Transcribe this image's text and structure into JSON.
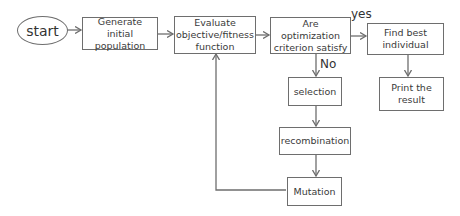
{
  "diagram": {
    "type": "flowchart",
    "colors": {
      "stroke": "#6e6e6e",
      "text": "#3a3a3a",
      "background": "#ffffff"
    },
    "nodes": {
      "start": {
        "label": "start",
        "shape": "ellipse"
      },
      "generate": {
        "label": "Generate initial population",
        "shape": "rect"
      },
      "evaluate": {
        "label": "Evaluate objective/fitness function",
        "shape": "rect"
      },
      "criterion": {
        "label": "Are optimization criterion satisfy",
        "shape": "rect"
      },
      "find_best": {
        "label": "Find best individual",
        "shape": "rect"
      },
      "print": {
        "label": "Print the result",
        "shape": "rect"
      },
      "selection": {
        "label": "selection",
        "shape": "rect"
      },
      "recombination": {
        "label": "recombination",
        "shape": "rect"
      },
      "mutation": {
        "label": "Mutation",
        "shape": "rect"
      }
    },
    "edge_labels": {
      "yes": "yes",
      "no": "No"
    },
    "edges": [
      {
        "from": "start",
        "to": "generate"
      },
      {
        "from": "generate",
        "to": "evaluate"
      },
      {
        "from": "evaluate",
        "to": "criterion"
      },
      {
        "from": "criterion",
        "to": "find_best",
        "label": "yes"
      },
      {
        "from": "find_best",
        "to": "print"
      },
      {
        "from": "criterion",
        "to": "selection",
        "label": "No"
      },
      {
        "from": "selection",
        "to": "recombination"
      },
      {
        "from": "recombination",
        "to": "mutation"
      },
      {
        "from": "mutation",
        "to": "evaluate"
      }
    ]
  }
}
